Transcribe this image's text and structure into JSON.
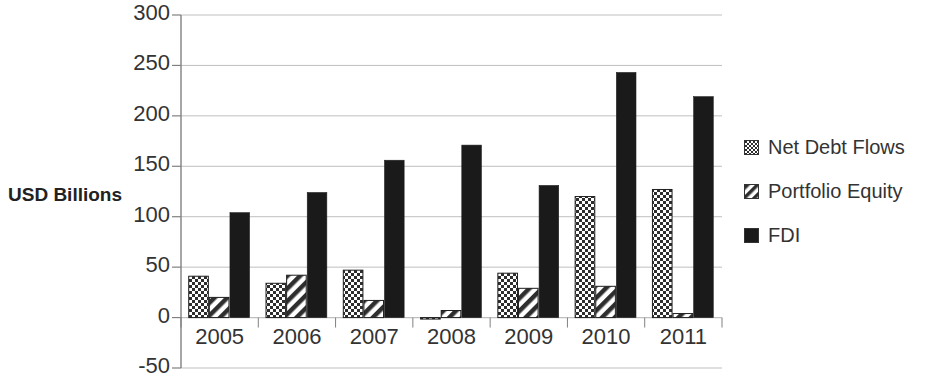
{
  "chart_data": {
    "type": "bar",
    "title": "",
    "xlabel": "",
    "ylabel": "USD Billions",
    "categories": [
      "2005",
      "2006",
      "2007",
      "2008",
      "2009",
      "2010",
      "2011"
    ],
    "series": [
      {
        "name": "Net Debt Flows",
        "pattern": "checkerboard",
        "color": "#3a3a3a",
        "values": [
          41,
          34,
          47,
          -1,
          44,
          120,
          127
        ]
      },
      {
        "name": "Portfolio Equity",
        "pattern": "diagonal-stripes",
        "color": "#3a3a3a",
        "values": [
          20,
          42,
          17,
          7,
          29,
          31,
          4
        ]
      },
      {
        "name": "FDI",
        "pattern": "solid",
        "color": "#1a1a1a",
        "values": [
          104,
          124,
          156,
          171,
          131,
          243,
          219
        ]
      }
    ],
    "ylim": [
      -50,
      300
    ],
    "yticks": [
      -50,
      0,
      50,
      100,
      150,
      200,
      250,
      300
    ],
    "ytick_labels": [
      "-50",
      "0",
      "50",
      "100",
      "150",
      "200",
      "250",
      "300"
    ],
    "grid": true,
    "grid_axis": "y",
    "legend_position": "right",
    "gridline_color": "#bfbfbf",
    "axis_color": "#808080"
  },
  "legend": {
    "items": [
      {
        "label": "Net Debt Flows"
      },
      {
        "label": "Portfolio Equity"
      },
      {
        "label": "FDI"
      }
    ]
  }
}
